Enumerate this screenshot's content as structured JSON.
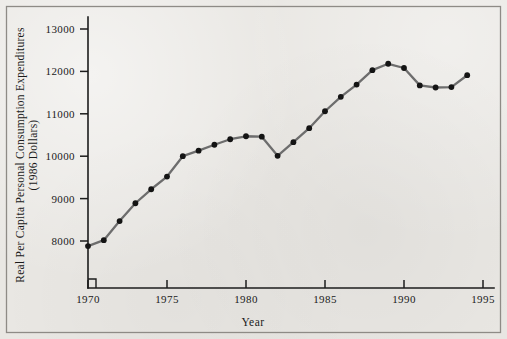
{
  "chart_data": {
    "type": "line",
    "title": "",
    "xlabel": "Year",
    "ylabel": "Real Per Capita Personal Consumption Expenditures (1986 Dollars)",
    "ylabel_line1": "Real Per Capita Personal Consumption Expenditures",
    "ylabel_line2": "(1986 Dollars)",
    "x": [
      1970,
      1971,
      1972,
      1973,
      1974,
      1975,
      1976,
      1977,
      1978,
      1979,
      1980,
      1981,
      1982,
      1983,
      1984,
      1985,
      1986,
      1987,
      1988,
      1989,
      1990,
      1991,
      1992,
      1993,
      1994
    ],
    "values": [
      7880,
      8020,
      8470,
      8890,
      9220,
      9520,
      10000,
      10130,
      10270,
      10400,
      10470,
      10460,
      10010,
      10330,
      10660,
      11060,
      11400,
      11690,
      12030,
      12180,
      12080,
      11670,
      11620,
      11630,
      11910
    ],
    "series": [
      {
        "name": "Real Per Capita Personal Consumption Expenditures",
        "values": [
          7880,
          8020,
          8470,
          8890,
          9220,
          9520,
          10000,
          10130,
          10270,
          10400,
          10470,
          10460,
          10010,
          10330,
          10660,
          11060,
          11400,
          11690,
          12030,
          12180,
          12080,
          11670,
          11620,
          11630,
          11910
        ]
      }
    ],
    "xlim": [
      1970,
      1995
    ],
    "ylim": [
      7600,
      13250
    ],
    "xticks": [
      1970,
      1975,
      1980,
      1985,
      1990,
      1995
    ],
    "xtick_labels": [
      "1970",
      "1975",
      "1980",
      "1985",
      "1990",
      "1995"
    ],
    "yticks": [
      8000,
      9000,
      10000,
      11000,
      12000,
      13000
    ],
    "ytick_labels": [
      "8000",
      "9000",
      "10000",
      "11000",
      "12000",
      "13000"
    ],
    "grid": false,
    "legend": false,
    "legend_position": "none",
    "axis_break": true,
    "marker": "filled-circle",
    "colors": {
      "line": "#6d6d6d",
      "marker": "#141414",
      "axis": "#1c1c1c",
      "text": "#1a1a1a",
      "background": "#e9e7e3",
      "frame": "#8e8b86"
    }
  }
}
